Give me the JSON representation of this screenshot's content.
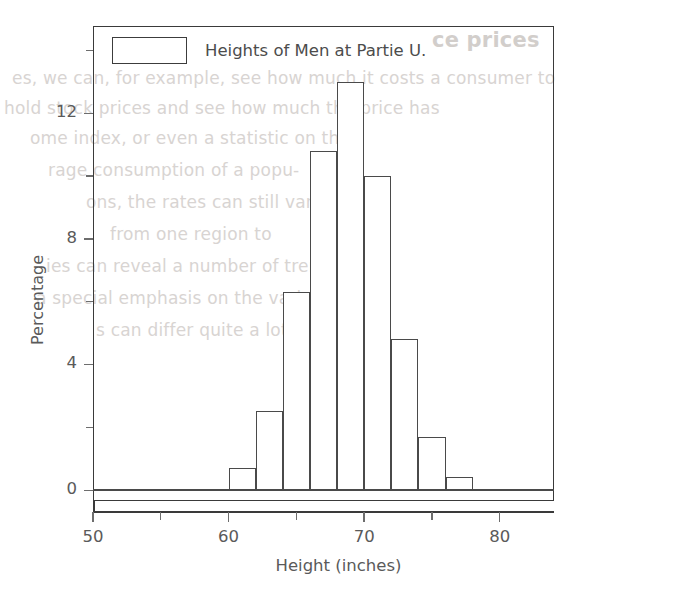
{
  "page": {
    "background_color": "#ffffff",
    "ink_color": "#4a4a4a",
    "bleed_through": [
      {
        "text": "ce prices",
        "style": "head",
        "x": 432,
        "y": 28
      },
      {
        "text": "es, we can, for example, see how much it costs a consumer to",
        "style": "body",
        "x": 12,
        "y": 68
      },
      {
        "text": "hold stock prices and see how much the price has",
        "style": "body",
        "x": 4,
        "y": 98
      },
      {
        "text": "ome index,  or  even  a  statistic  on  the",
        "style": "body",
        "x": 30,
        "y": 128
      },
      {
        "text": "rage   consumption   of   a   popu-",
        "style": "body",
        "x": 48,
        "y": 160
      },
      {
        "text": "ons, the rates can still vary",
        "style": "body",
        "x": 86,
        "y": 192
      },
      {
        "text": "from  one  region  to",
        "style": "body",
        "x": 110,
        "y": 224
      },
      {
        "text": "ies can reveal a number of trends with",
        "style": "body",
        "x": 46,
        "y": 256
      },
      {
        "text": "a special emphasis on the variation",
        "style": "body",
        "x": 36,
        "y": 288
      },
      {
        "text": "s can differ quite a lot",
        "style": "body",
        "x": 96,
        "y": 320
      }
    ]
  },
  "chart_data": {
    "type": "bar",
    "title": "",
    "subtitle": "",
    "xlabel": "Height (inches)",
    "ylabel": "Percentage",
    "legend": {
      "position": "top-left-inside",
      "entries": [
        "Heights of Men at Partie U."
      ]
    },
    "grid": false,
    "xlim": [
      50,
      84
    ],
    "ylim": [
      0,
      14.5
    ],
    "x_major_ticks": [
      50,
      60,
      70,
      80
    ],
    "x_minor_ticks": [
      55,
      65,
      75
    ],
    "x_tick_labels": [
      "50",
      "60",
      "70",
      "80"
    ],
    "y_major_ticks": [
      0,
      4,
      8,
      12
    ],
    "y_minor_ticks": [
      2,
      6,
      10,
      14
    ],
    "y_tick_labels": [
      "0",
      "4",
      "8",
      "12"
    ],
    "bin_width": 2,
    "bin_edges": [
      60,
      62,
      64,
      66,
      68,
      70,
      72,
      74,
      76,
      78
    ],
    "categories": [
      "60-62",
      "62-64",
      "64-66",
      "66-68",
      "68-70",
      "70-72",
      "72-74",
      "74-76",
      "76-78"
    ],
    "values": [
      0.7,
      2.5,
      6.3,
      10.8,
      13.0,
      10.0,
      4.8,
      1.7,
      0.4
    ]
  }
}
